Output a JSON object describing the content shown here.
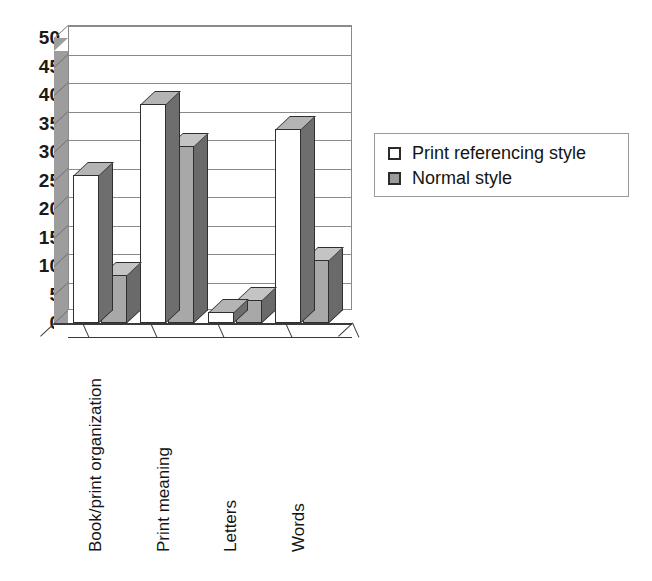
{
  "chart_data": {
    "type": "bar",
    "title": "",
    "subtitle": "",
    "xlabel": "",
    "ylabel": "",
    "ylim": [
      0,
      50
    ],
    "yticks": [
      0,
      5,
      10,
      15,
      20,
      25,
      30,
      35,
      40,
      45,
      50
    ],
    "ytick_labels": [
      "0",
      "5",
      "10",
      "15",
      "20",
      "25",
      "30",
      "35",
      "40",
      "45",
      "50"
    ],
    "grid": true,
    "grid_axis": "y",
    "legend_position": "right",
    "style": "3d-clustered-column",
    "categories": [
      "Book/print organization",
      "Print meaning",
      "Letters",
      "Words"
    ],
    "series": [
      {
        "name": "Print referencing style",
        "color": "#ffffff",
        "values": [
          26,
          38.5,
          2,
          34
        ]
      },
      {
        "name": "Normal style",
        "color": "#a8a8a8",
        "values": [
          8.5,
          31,
          4,
          11
        ]
      }
    ],
    "annotations": []
  },
  "legend": {
    "entries": [
      {
        "label": "Print referencing style",
        "swatch": "white"
      },
      {
        "label": "Normal style",
        "swatch": "gray"
      }
    ]
  },
  "colors": {
    "series1_fill": "#ffffff",
    "series2_fill": "#a8a8a8",
    "bar_outline": "#2f2f2f",
    "gridline": "#8a8a8a",
    "sidewall": "#9d9d9d",
    "axis": "#3a3a3a",
    "text": "#141414",
    "background": "#ffffff"
  }
}
